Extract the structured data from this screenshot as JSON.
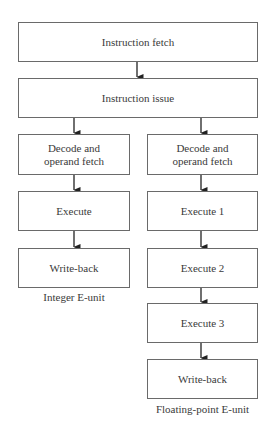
{
  "diagram": {
    "type": "flowchart",
    "shared_stages": [
      {
        "id": "fetch",
        "label": "Instruction fetch"
      },
      {
        "id": "issue",
        "label": "Instruction issue"
      }
    ],
    "integer_unit": {
      "title": "Integer E-unit",
      "stages": [
        {
          "id": "int-decode",
          "label": "Decode and\noperand fetch"
        },
        {
          "id": "int-execute",
          "label": "Execute"
        },
        {
          "id": "int-writeback",
          "label": "Write-back"
        }
      ]
    },
    "fp_unit": {
      "title": "Floating-point E-unit",
      "stages": [
        {
          "id": "fp-decode",
          "label": "Decode and\noperand fetch"
        },
        {
          "id": "fp-execute1",
          "label": "Execute 1"
        },
        {
          "id": "fp-execute2",
          "label": "Execute 2"
        },
        {
          "id": "fp-execute3",
          "label": "Execute 3"
        },
        {
          "id": "fp-writeback",
          "label": "Write-back"
        }
      ]
    },
    "edges": [
      [
        "fetch",
        "issue"
      ],
      [
        "issue",
        "int-decode"
      ],
      [
        "int-decode",
        "int-execute"
      ],
      [
        "int-execute",
        "int-writeback"
      ],
      [
        "issue",
        "fp-decode"
      ],
      [
        "fp-decode",
        "fp-execute1"
      ],
      [
        "fp-execute1",
        "fp-execute2"
      ],
      [
        "fp-execute2",
        "fp-execute3"
      ],
      [
        "fp-execute3",
        "fp-writeback"
      ]
    ],
    "colors": {
      "stroke": "#6a6a6a",
      "text": "#3a3a3a",
      "background": "#ffffff"
    }
  }
}
